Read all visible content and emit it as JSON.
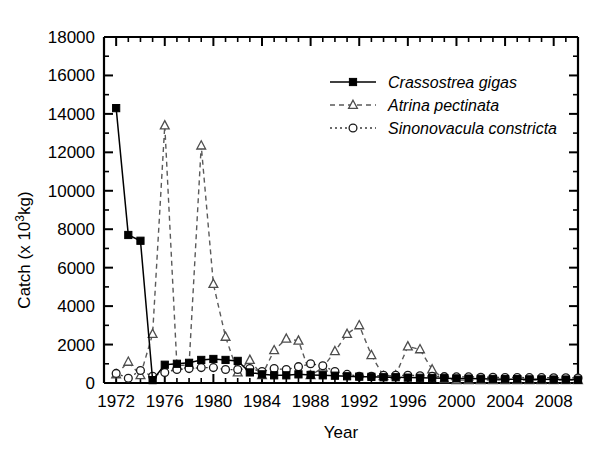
{
  "chart_data": {
    "type": "line",
    "title": "",
    "xlabel": "Year",
    "ylabel": "Catch (x 10³kg)",
    "ylabel_parts": {
      "pre": "Catch (x 10",
      "sup": "3",
      "post": "kg)"
    },
    "xlim": [
      1971,
      2010
    ],
    "ylim": [
      0,
      18000
    ],
    "ytick_step": 2000,
    "xtick_step": 4,
    "minor_ticks": true,
    "grid": false,
    "legend_position": "upper-center-right",
    "ytick_labels": [
      "0",
      "2000",
      "4000",
      "6000",
      "8000",
      "10000",
      "12000",
      "14000",
      "16000",
      "18000"
    ],
    "ytick_values": [
      0,
      2000,
      4000,
      6000,
      8000,
      10000,
      12000,
      14000,
      16000,
      18000
    ],
    "xtick_labels": [
      "1972",
      "1976",
      "1980",
      "1984",
      "1988",
      "1992",
      "1996",
      "2000",
      "2004",
      "2008"
    ],
    "xtick_values": [
      1972,
      1976,
      1980,
      1984,
      1988,
      1992,
      1996,
      2000,
      2004,
      2008
    ],
    "x": [
      1972,
      1973,
      1974,
      1975,
      1976,
      1977,
      1978,
      1979,
      1980,
      1981,
      1982,
      1983,
      1984,
      1985,
      1986,
      1987,
      1988,
      1989,
      1990,
      1991,
      1992,
      1993,
      1994,
      1995,
      1996,
      1997,
      1998,
      1999,
      2000,
      2001,
      2002,
      2003,
      2004,
      2005,
      2006,
      2007,
      2008,
      2009,
      2010
    ],
    "series": [
      {
        "name": "Crassostrea gigas",
        "style": "solid",
        "marker": "filled-square",
        "color": "#000000",
        "values": [
          14300,
          7700,
          7400,
          150,
          950,
          1000,
          1050,
          1200,
          1250,
          1200,
          1150,
          550,
          450,
          400,
          400,
          450,
          420,
          400,
          380,
          350,
          330,
          320,
          300,
          300,
          280,
          270,
          260,
          250,
          240,
          230,
          220,
          210,
          200,
          200,
          190,
          190,
          180,
          180,
          170
        ]
      },
      {
        "name": "Atrina pectinata",
        "style": "dashed",
        "marker": "open-triangle",
        "color": "#5a5a5a",
        "values": [
          450,
          1100,
          400,
          2550,
          13400,
          900,
          950,
          12350,
          5150,
          2400,
          550,
          1200,
          400,
          1700,
          2300,
          2200,
          400,
          800,
          1650,
          2550,
          3000,
          1450,
          350,
          400,
          1900,
          1750,
          700,
          200,
          150,
          150,
          150,
          150,
          150,
          150,
          150,
          150,
          150,
          150,
          150
        ]
      },
      {
        "name": "Sinonovacula constricta",
        "style": "dotted",
        "marker": "open-circle",
        "color": "#1a1a1a",
        "values": [
          500,
          250,
          650,
          350,
          550,
          700,
          750,
          800,
          800,
          700,
          700,
          750,
          600,
          750,
          700,
          850,
          1000,
          900,
          600,
          450,
          350,
          350,
          400,
          400,
          400,
          380,
          350,
          330,
          320,
          320,
          300,
          300,
          290,
          290,
          280,
          280,
          270,
          270,
          260
        ]
      }
    ],
    "legend": [
      {
        "label": "Crassostrea gigas",
        "style": "solid",
        "marker": "filled-square"
      },
      {
        "label": "Atrina pectinata",
        "style": "dashed",
        "marker": "open-triangle"
      },
      {
        "label": "Sinonovacula constricta",
        "style": "dotted",
        "marker": "open-circle"
      }
    ]
  }
}
